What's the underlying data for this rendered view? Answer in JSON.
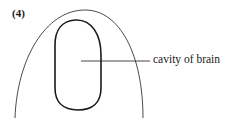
{
  "figure": {
    "number_label": "(4)",
    "annotations": [
      {
        "text": "cavity of brain",
        "points_to": "inner-oval-center"
      }
    ],
    "colors": {
      "stroke": "#1a1a1a",
      "background": "#ffffff"
    }
  }
}
